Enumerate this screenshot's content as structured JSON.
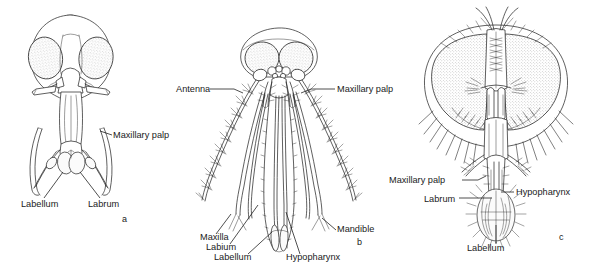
{
  "figure": {
    "background_color": "#ffffff",
    "ink_color": "#2b2b2b",
    "eye_fill_color": "#e8e8e8",
    "width": 596,
    "height": 271
  },
  "panels": [
    {
      "id": "a",
      "caption": "a",
      "subject": "biting fly head, ventral view",
      "labels": [
        {
          "text": "Maxillary palp",
          "x": 113,
          "y": 138,
          "anchor": "start"
        },
        {
          "text": "Labellum",
          "x": 21,
          "y": 207,
          "anchor": "start"
        },
        {
          "text": "Labrum",
          "x": 88,
          "y": 207,
          "anchor": "start"
        }
      ]
    },
    {
      "id": "b",
      "caption": "b",
      "subject": "mosquito head with piercing stylets",
      "labels": [
        {
          "text": "Antenna",
          "x": 176,
          "y": 92,
          "anchor": "start"
        },
        {
          "text": "Maxillary palp",
          "x": 337,
          "y": 92,
          "anchor": "start"
        },
        {
          "text": "Maxilla",
          "x": 200,
          "y": 240,
          "anchor": "start"
        },
        {
          "text": "Labium",
          "x": 206,
          "y": 250,
          "anchor": "start"
        },
        {
          "text": "Labellum",
          "x": 214,
          "y": 260,
          "anchor": "start"
        },
        {
          "text": "Hypopharynx",
          "x": 286,
          "y": 260,
          "anchor": "start"
        },
        {
          "text": "Mandible",
          "x": 337,
          "y": 232,
          "anchor": "start"
        }
      ]
    },
    {
      "id": "c",
      "caption": "c",
      "subject": "house fly head with sponging proboscis",
      "labels": [
        {
          "text": "Maxillary palp",
          "x": 389,
          "y": 183,
          "anchor": "start"
        },
        {
          "text": "Hypopharynx",
          "x": 516,
          "y": 195,
          "anchor": "start"
        },
        {
          "text": "Labrum",
          "x": 424,
          "y": 202,
          "anchor": "start"
        },
        {
          "text": "Labellum",
          "x": 467,
          "y": 251,
          "anchor": "start"
        }
      ]
    }
  ],
  "panel_captions": {
    "a": {
      "text": "a",
      "x": 122,
      "y": 222
    },
    "b": {
      "text": "b",
      "x": 357,
      "y": 245
    },
    "c": {
      "text": "c",
      "x": 559,
      "y": 240
    }
  },
  "terms": [
    "Maxillary palp",
    "Labellum",
    "Labrum",
    "Antenna",
    "Maxilla",
    "Labium",
    "Hypopharynx",
    "Mandible"
  ]
}
